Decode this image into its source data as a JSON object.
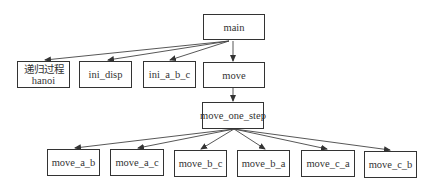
{
  "diagram": {
    "type": "call-tree",
    "nodes": [
      {
        "id": "main",
        "label": "main",
        "x": 203,
        "y": 14,
        "w": 62,
        "h": 26
      },
      {
        "id": "hanoi",
        "label_line1": "递归过程",
        "label_line2": "hanoi",
        "x": 17,
        "y": 61,
        "w": 53,
        "h": 27
      },
      {
        "id": "ini_disp",
        "label": "ini_disp",
        "x": 79,
        "y": 61,
        "w": 53,
        "h": 27
      },
      {
        "id": "ini_a_b_c",
        "label": "ini_a_b_c",
        "x": 143,
        "y": 61,
        "w": 53,
        "h": 27
      },
      {
        "id": "move",
        "label": "move",
        "x": 203,
        "y": 62,
        "w": 62,
        "h": 26
      },
      {
        "id": "move_one_step",
        "label": "move_one_step",
        "x": 202,
        "y": 102,
        "w": 62,
        "h": 27
      },
      {
        "id": "move_a_b",
        "label": "move_a_b",
        "x": 47,
        "y": 149,
        "w": 53,
        "h": 27
      },
      {
        "id": "move_a_c",
        "label": "move_a_c",
        "x": 110,
        "y": 149,
        "w": 54,
        "h": 27
      },
      {
        "id": "move_b_c",
        "label": "move_b_c",
        "x": 174,
        "y": 150,
        "w": 53,
        "h": 27
      },
      {
        "id": "move_b_a",
        "label": "move_b_a",
        "x": 237,
        "y": 150,
        "w": 53,
        "h": 27
      },
      {
        "id": "move_c_a",
        "label": "move_c_a",
        "x": 301,
        "y": 150,
        "w": 54,
        "h": 27
      },
      {
        "id": "move_c_b",
        "label": "move_c_b",
        "x": 364,
        "y": 151,
        "w": 53,
        "h": 27
      }
    ],
    "edges": [
      {
        "from": "main",
        "to": "hanoi"
      },
      {
        "from": "main",
        "to": "ini_disp"
      },
      {
        "from": "main",
        "to": "ini_a_b_c"
      },
      {
        "from": "main",
        "to": "move"
      },
      {
        "from": "move",
        "to": "move_one_step"
      },
      {
        "from": "move_one_step",
        "to": "move_a_b"
      },
      {
        "from": "move_one_step",
        "to": "move_a_c"
      },
      {
        "from": "move_one_step",
        "to": "move_b_c"
      },
      {
        "from": "move_one_step",
        "to": "move_b_a"
      },
      {
        "from": "move_one_step",
        "to": "move_c_a"
      },
      {
        "from": "move_one_step",
        "to": "move_c_b"
      }
    ]
  }
}
